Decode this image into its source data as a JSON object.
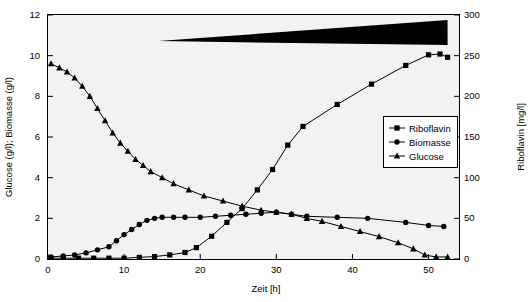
{
  "chart_data": {
    "type": "line",
    "title": "",
    "xlabel": "Zeit [h]",
    "ylabel_left": "Glucose (g/l); Biomasse (g/l)",
    "ylabel_right": "Riboflavin [mg/l]",
    "xlim": [
      0,
      54
    ],
    "ylim_left": [
      0,
      12
    ],
    "ylim_right": [
      0,
      300
    ],
    "xticks": [
      0,
      10,
      20,
      30,
      40,
      50
    ],
    "yticks_left": [
      0,
      2,
      4,
      6,
      8,
      10,
      12
    ],
    "yticks_right": [
      0,
      50,
      100,
      150,
      200,
      250,
      300
    ],
    "grid": false,
    "legend_position": "right",
    "legend": [
      "Riboflavin",
      "Biomasse",
      "Glucose"
    ],
    "annotation": {
      "name": "feed-wedge",
      "description": "black triangular wedge indicating increasing feed rate",
      "x_start": 14.5,
      "x_end": 52.5
    },
    "series": [
      {
        "name": "Riboflavin",
        "axis": "right",
        "unit": "mg/l",
        "marker": "square",
        "points": [
          [
            0.4,
            1
          ],
          [
            2,
            1
          ],
          [
            4,
            1
          ],
          [
            6,
            1
          ],
          [
            8,
            1
          ],
          [
            10,
            1
          ],
          [
            12,
            2
          ],
          [
            14,
            3
          ],
          [
            16,
            5
          ],
          [
            18,
            8
          ],
          [
            19.5,
            14
          ],
          [
            21.5,
            28
          ],
          [
            23.5,
            45
          ],
          [
            25.5,
            62
          ],
          [
            27.5,
            85
          ],
          [
            29.5,
            110
          ],
          [
            31.5,
            140
          ],
          [
            33.5,
            163
          ],
          [
            38,
            190
          ],
          [
            42.5,
            215
          ],
          [
            47,
            238
          ],
          [
            50,
            251
          ],
          [
            51.5,
            252
          ],
          [
            52.5,
            248
          ]
        ]
      },
      {
        "name": "Biomasse",
        "axis": "left",
        "unit": "g/l",
        "marker": "circle",
        "points": [
          [
            0.4,
            0.1
          ],
          [
            2,
            0.15
          ],
          [
            3.5,
            0.2
          ],
          [
            5,
            0.3
          ],
          [
            6.5,
            0.45
          ],
          [
            8,
            0.6
          ],
          [
            9,
            0.9
          ],
          [
            10,
            1.2
          ],
          [
            11,
            1.45
          ],
          [
            12,
            1.7
          ],
          [
            13,
            1.9
          ],
          [
            14,
            2.0
          ],
          [
            15,
            2.05
          ],
          [
            16.5,
            2.05
          ],
          [
            18,
            2.05
          ],
          [
            20,
            2.05
          ],
          [
            22,
            2.1
          ],
          [
            24,
            2.15
          ],
          [
            26,
            2.2
          ],
          [
            28,
            2.25
          ],
          [
            30,
            2.3
          ],
          [
            32,
            2.2
          ],
          [
            34,
            2.1
          ],
          [
            38,
            2.05
          ],
          [
            42,
            2.0
          ],
          [
            47,
            1.8
          ],
          [
            50,
            1.65
          ],
          [
            52,
            1.6
          ]
        ]
      },
      {
        "name": "Glucose",
        "axis": "left",
        "unit": "g/l",
        "marker": "triangle",
        "points": [
          [
            0.4,
            9.6
          ],
          [
            1.5,
            9.4
          ],
          [
            2.5,
            9.2
          ],
          [
            3.5,
            8.9
          ],
          [
            4.5,
            8.5
          ],
          [
            5.5,
            8.0
          ],
          [
            6.5,
            7.4
          ],
          [
            7.5,
            6.8
          ],
          [
            8.5,
            6.2
          ],
          [
            9.5,
            5.7
          ],
          [
            10.5,
            5.3
          ],
          [
            11.5,
            4.9
          ],
          [
            12.5,
            4.6
          ],
          [
            13.5,
            4.3
          ],
          [
            15,
            4.0
          ],
          [
            16.5,
            3.7
          ],
          [
            18.5,
            3.4
          ],
          [
            20.5,
            3.1
          ],
          [
            23,
            2.85
          ],
          [
            25.5,
            2.6
          ],
          [
            28,
            2.4
          ],
          [
            30,
            2.3
          ],
          [
            32,
            2.2
          ],
          [
            34,
            2.0
          ],
          [
            36,
            1.85
          ],
          [
            38.5,
            1.6
          ],
          [
            41,
            1.35
          ],
          [
            43.5,
            1.1
          ],
          [
            46,
            0.8
          ],
          [
            48,
            0.5
          ],
          [
            49.5,
            0.2
          ],
          [
            51,
            0.1
          ],
          [
            52.5,
            0.1
          ]
        ]
      }
    ]
  }
}
